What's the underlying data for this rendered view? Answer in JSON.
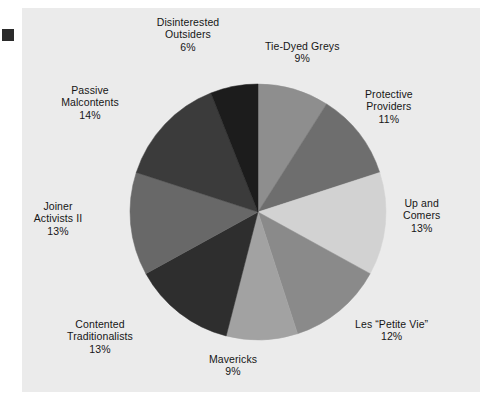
{
  "figure": {
    "background": "#ffffff",
    "panel_background": "#ebebeb",
    "corner_mark_color": "#2b2b2b",
    "text_color": "#161616"
  },
  "chart_data": {
    "type": "pie",
    "title": "",
    "subtitle": "",
    "xlabel": "",
    "ylabel": "",
    "grid": false,
    "legend_position": "outside-labels",
    "start_angle_deg": 0,
    "direction": "clockwise",
    "center": {
      "x": 258,
      "y": 212
    },
    "radius": 128,
    "categories": [
      "Tie-Dyed Greys",
      "Protective Providers",
      "Up and Comers",
      "Les “Petite Vie”",
      "Mavericks",
      "Contented Traditionalists",
      "Joiner Activists II",
      "Passive Malcontents",
      "Disinterested Outsiders"
    ],
    "values": [
      9,
      11,
      13,
      12,
      9,
      13,
      13,
      14,
      6
    ],
    "value_labels": [
      "9%",
      "11%",
      "13%",
      "12%",
      "9%",
      "13%",
      "13%",
      "14%",
      "6%"
    ],
    "colors": [
      "#8e8e8e",
      "#6e6e6e",
      "#d2d2d2",
      "#8a8a8a",
      "#a2a2a2",
      "#2e2e2e",
      "#686868",
      "#3b3b3b",
      "#1c1c1c"
    ],
    "slices": [
      {
        "name": "Tie-Dyed Greys",
        "value": 9,
        "pct_label": "9%",
        "color": "#8e8e8e",
        "start_deg": 0.0,
        "end_deg": 32.4,
        "label_lines": [
          "Tie-Dyed Greys",
          "9%"
        ],
        "label_x": 265,
        "label_y": 40,
        "label_align": "left"
      },
      {
        "name": "Protective Providers",
        "value": 11,
        "pct_label": "11%",
        "color": "#6e6e6e",
        "start_deg": 32.4,
        "end_deg": 72.0,
        "label_lines": [
          "Protective",
          "Providers",
          "11%"
        ],
        "label_x": 365,
        "label_y": 88,
        "label_align": "left"
      },
      {
        "name": "Up and Comers",
        "value": 13,
        "pct_label": "13%",
        "color": "#d2d2d2",
        "start_deg": 72.0,
        "end_deg": 118.8,
        "label_lines": [
          "Up and",
          "Comers",
          "13%"
        ],
        "label_x": 403,
        "label_y": 197,
        "label_align": "left"
      },
      {
        "name": "Les “Petite Vie”",
        "value": 12,
        "pct_label": "12%",
        "color": "#8a8a8a",
        "start_deg": 118.8,
        "end_deg": 162.0,
        "label_lines": [
          "Les “Petite Vie”",
          "12%"
        ],
        "label_x": 355,
        "label_y": 318,
        "label_align": "left"
      },
      {
        "name": "Mavericks",
        "value": 9,
        "pct_label": "9%",
        "color": "#a2a2a2",
        "start_deg": 162.0,
        "end_deg": 194.4,
        "label_lines": [
          "Mavericks",
          "9%"
        ],
        "label_x": 233,
        "label_y": 353,
        "label_align": "center"
      },
      {
        "name": "Contented Traditionalists",
        "value": 13,
        "pct_label": "13%",
        "color": "#2e2e2e",
        "start_deg": 194.4,
        "end_deg": 241.2,
        "label_lines": [
          "Contented",
          "Traditionalists",
          "13%"
        ],
        "label_x": 100,
        "label_y": 318,
        "label_align": "center"
      },
      {
        "name": "Joiner Activists II",
        "value": 13,
        "pct_label": "13%",
        "color": "#686868",
        "start_deg": 241.2,
        "end_deg": 288.0,
        "label_lines": [
          "Joiner",
          "Activists II",
          "13%"
        ],
        "label_x": 58,
        "label_y": 200,
        "label_align": "center"
      },
      {
        "name": "Passive Malcontents",
        "value": 14,
        "pct_label": "14%",
        "color": "#3b3b3b",
        "start_deg": 288.0,
        "end_deg": 338.4,
        "label_lines": [
          "Passive",
          "Malcontents",
          "14%"
        ],
        "label_x": 90,
        "label_y": 84,
        "label_align": "center"
      },
      {
        "name": "Disinterested Outsiders",
        "value": 6,
        "pct_label": "6%",
        "color": "#1c1c1c",
        "start_deg": 338.4,
        "end_deg": 360.0,
        "label_lines": [
          "Disinterested",
          "Outsiders",
          "6%"
        ],
        "label_x": 188,
        "label_y": 16,
        "label_align": "center"
      }
    ]
  }
}
